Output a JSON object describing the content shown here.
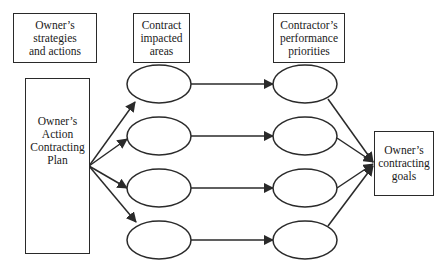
{
  "diagram": {
    "headers": {
      "owner_strategies": [
        "Owner’s",
        "strategies",
        "and actions"
      ],
      "contract_areas": [
        "Contract",
        "impacted",
        "areas"
      ],
      "contractor_priorities": [
        "Contractor’s",
        "performance",
        "priorities"
      ]
    },
    "action_plan": [
      "Owner’s",
      "Action",
      "Contracting",
      "Plan"
    ],
    "goals": [
      "Owner’s",
      "contracting",
      "goals"
    ],
    "impacted_area_nodes": 4,
    "priority_nodes": 4,
    "stroke_color": "#2a2a2a",
    "background": "#ffffff"
  }
}
